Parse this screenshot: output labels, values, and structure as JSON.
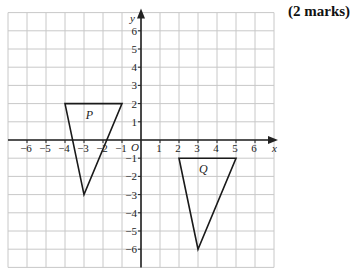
{
  "question": {
    "marks_label": "(2 marks)"
  },
  "diagram": {
    "axes": {
      "x_label": "x",
      "y_label": "y",
      "origin_label": "O",
      "x_ticks": [
        "−6",
        "−5",
        "−4",
        "−3",
        "−2",
        "−1",
        "1",
        "2",
        "3",
        "4",
        "5",
        "6"
      ],
      "y_ticks": [
        "6",
        "5",
        "4",
        "3",
        "2",
        "1",
        "−1",
        "−2",
        "−3",
        "−4",
        "−5",
        "−6"
      ],
      "x_range": [
        -7,
        7
      ],
      "y_range": [
        -7,
        7
      ]
    },
    "shapes": [
      {
        "label": "P",
        "vertices": [
          [
            -4,
            2
          ],
          [
            -1,
            2
          ],
          [
            -3,
            -3
          ]
        ]
      },
      {
        "label": "Q",
        "vertices": [
          [
            2,
            -1
          ],
          [
            5,
            -1
          ],
          [
            3,
            -6
          ]
        ]
      }
    ],
    "colors": {
      "grid": "#c8c8c8",
      "axis": "#222222",
      "shape": "#1a1a1a"
    }
  }
}
